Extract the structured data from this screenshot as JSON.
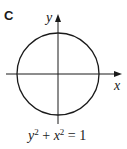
{
  "panel": {
    "label": "C"
  },
  "diagram": {
    "type": "circle-on-axes",
    "x_axis_label": "x",
    "y_axis_label": "y",
    "stroke_color": "#1a1a1a",
    "circle": {
      "cx": 58,
      "cy": 74,
      "r": 41
    }
  },
  "equation": {
    "y_var": "y",
    "y_exp": "2",
    "plus": " + ",
    "x_var": "x",
    "x_exp": "2",
    "equals": " = ",
    "rhs": "1"
  }
}
